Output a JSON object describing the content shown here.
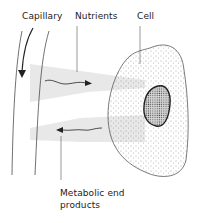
{
  "diagram": {
    "labels": {
      "capillary": "Capillary",
      "nutrients": "Nutrients",
      "cell": "Cell",
      "metabolic_line1": "Metabolic end",
      "metabolic_line2": "products"
    },
    "elements": [
      {
        "name": "capillary",
        "shape": "two curved vertical walls with downward flow arrow"
      },
      {
        "name": "nutrients-flow",
        "direction": "capillary-to-cell",
        "band_color": "#e6e6e6"
      },
      {
        "name": "metabolic-flow",
        "direction": "cell-to-capillary",
        "band_color": "#e6e6e6"
      },
      {
        "name": "cell",
        "shape": "stippled irregular oval"
      },
      {
        "name": "nucleus",
        "shape": "dense stippled oval with thick outline"
      }
    ],
    "colors": {
      "line": "#333333",
      "band": "#e8e8e8",
      "background": "#ffffff"
    }
  }
}
